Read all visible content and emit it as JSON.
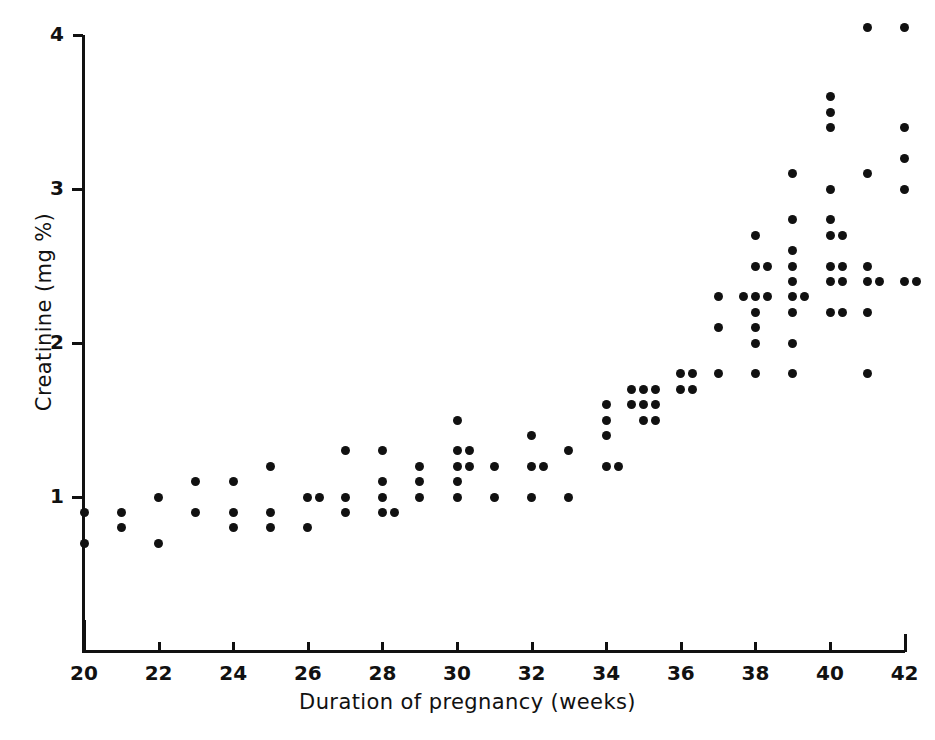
{
  "figure": {
    "title": "",
    "background": "#ffffff",
    "ink_color": "#111111"
  },
  "axes": {
    "x_title": "Duration of pregnancy (weeks)",
    "y_title": "Creatinine (mg %)",
    "x_ticks": [
      20,
      22,
      24,
      26,
      28,
      30,
      32,
      34,
      36,
      38,
      40,
      42
    ],
    "y_ticks": [
      1,
      2,
      3,
      4
    ],
    "x_tick_labels": [
      "20",
      "22",
      "24",
      "26",
      "28",
      "30",
      "32",
      "34",
      "36",
      "38",
      "40",
      "42"
    ],
    "y_tick_labels": [
      "1",
      "2",
      "3",
      "4"
    ]
  },
  "chart_data": {
    "type": "scatter",
    "title": "",
    "xlabel": "Duration of pregnancy (weeks)",
    "ylabel": "Creatinine (mg %)",
    "xlim": [
      20,
      42
    ],
    "ylim": [
      0.55,
      4.1
    ],
    "grid": false,
    "legend": null,
    "marker": "filled-circle",
    "marker_color": "#111111",
    "series": [
      {
        "name": "Creatinine vs gestational age",
        "points": [
          [
            20,
            0.9
          ],
          [
            20,
            0.7
          ],
          [
            21,
            0.9
          ],
          [
            21,
            0.8
          ],
          [
            22,
            1.0
          ],
          [
            22,
            0.7
          ],
          [
            23,
            1.1
          ],
          [
            23,
            0.9
          ],
          [
            24,
            1.1
          ],
          [
            24,
            0.9
          ],
          [
            24,
            0.8
          ],
          [
            25,
            1.2
          ],
          [
            25,
            0.9
          ],
          [
            25,
            0.8
          ],
          [
            26,
            1.0
          ],
          [
            26,
            1.0
          ],
          [
            26,
            0.8
          ],
          [
            27,
            1.3
          ],
          [
            27,
            1.0
          ],
          [
            27,
            0.9
          ],
          [
            28,
            1.3
          ],
          [
            28,
            1.1
          ],
          [
            28,
            1.0
          ],
          [
            28,
            0.9
          ],
          [
            28,
            0.9
          ],
          [
            29,
            1.2
          ],
          [
            29,
            1.1
          ],
          [
            29,
            1.0
          ],
          [
            30,
            1.5
          ],
          [
            30,
            1.3
          ],
          [
            30,
            1.3
          ],
          [
            30,
            1.2
          ],
          [
            30,
            1.2
          ],
          [
            30,
            1.1
          ],
          [
            30,
            1.0
          ],
          [
            31,
            1.2
          ],
          [
            31,
            1.0
          ],
          [
            32,
            1.4
          ],
          [
            32,
            1.2
          ],
          [
            32,
            1.2
          ],
          [
            32,
            1.0
          ],
          [
            33,
            1.3
          ],
          [
            33,
            1.0
          ],
          [
            34,
            1.6
          ],
          [
            34,
            1.5
          ],
          [
            34,
            1.4
          ],
          [
            34,
            1.2
          ],
          [
            34,
            1.2
          ],
          [
            35,
            1.7
          ],
          [
            35,
            1.7
          ],
          [
            35,
            1.7
          ],
          [
            35,
            1.6
          ],
          [
            35,
            1.6
          ],
          [
            35,
            1.6
          ],
          [
            35,
            1.5
          ],
          [
            35,
            1.5
          ],
          [
            36,
            1.8
          ],
          [
            36,
            1.8
          ],
          [
            36,
            1.7
          ],
          [
            36,
            1.7
          ],
          [
            37,
            2.3
          ],
          [
            37,
            2.1
          ],
          [
            37,
            1.8
          ],
          [
            38,
            2.7
          ],
          [
            38,
            2.5
          ],
          [
            38,
            2.5
          ],
          [
            38,
            2.3
          ],
          [
            38,
            2.3
          ],
          [
            38,
            2.3
          ],
          [
            38,
            2.2
          ],
          [
            38,
            2.1
          ],
          [
            38,
            2.0
          ],
          [
            38,
            1.8
          ],
          [
            39,
            3.1
          ],
          [
            39,
            2.8
          ],
          [
            39,
            2.6
          ],
          [
            39,
            2.5
          ],
          [
            39,
            2.4
          ],
          [
            39,
            2.3
          ],
          [
            39,
            2.3
          ],
          [
            39,
            2.2
          ],
          [
            39,
            2.0
          ],
          [
            39,
            1.8
          ],
          [
            40,
            3.6
          ],
          [
            40,
            3.5
          ],
          [
            40,
            3.4
          ],
          [
            40,
            3.0
          ],
          [
            40,
            2.8
          ],
          [
            40,
            2.7
          ],
          [
            40,
            2.7
          ],
          [
            40,
            2.5
          ],
          [
            40,
            2.5
          ],
          [
            40,
            2.4
          ],
          [
            40,
            2.4
          ],
          [
            40,
            2.2
          ],
          [
            40,
            2.2
          ],
          [
            41,
            4.05
          ],
          [
            41,
            3.1
          ],
          [
            41,
            2.5
          ],
          [
            41,
            2.4
          ],
          [
            41,
            2.4
          ],
          [
            41,
            2.2
          ],
          [
            41,
            1.8
          ],
          [
            42,
            4.05
          ],
          [
            42,
            3.4
          ],
          [
            42,
            3.2
          ],
          [
            42,
            3.0
          ],
          [
            42,
            2.4
          ],
          [
            42,
            2.4
          ]
        ]
      }
    ]
  },
  "geometry": {
    "x_origin_px": 84,
    "x_scale_px_per_week": 37.3,
    "y_one_px": 497,
    "y_scale_px_per_unit": 154
  }
}
